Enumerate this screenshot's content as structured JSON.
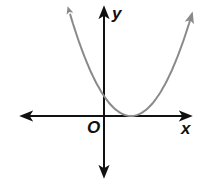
{
  "chart_data": {
    "type": "line",
    "title": "",
    "xlabel": "x",
    "ylabel": "y",
    "origin_label": "O",
    "grid": false,
    "legend": null,
    "series": [
      {
        "name": "parabola",
        "equation": "y = (x - 1)^2",
        "shape": "upward-opening parabola",
        "vertex": [
          1,
          0
        ],
        "y_intercept": 1,
        "x_intercepts": [
          1
        ],
        "color": "#8a8a8a",
        "arrows_at_ends": true,
        "x": [
          -1.26,
          -1,
          -0.5,
          0,
          0.5,
          1,
          1.5,
          2,
          2.5,
          3,
          3.26
        ],
        "values": [
          5.11,
          4,
          2.25,
          1,
          0.25,
          0,
          0.25,
          1,
          2.25,
          4,
          5.11
        ]
      }
    ],
    "axes": {
      "color": "#111111",
      "arrows_both_directions": true,
      "tick_labels": false
    }
  },
  "labels": {
    "x_axis": "x",
    "y_axis": "y",
    "origin": "O"
  },
  "colors": {
    "axis": "#111111",
    "curve": "#8a8a8a",
    "background": "#ffffff"
  }
}
